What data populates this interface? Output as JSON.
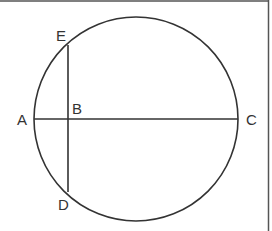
{
  "figure": {
    "stroke_color": "#333333",
    "border_color": "#555555",
    "points": {
      "A": {
        "label": "A",
        "x": 34,
        "y": 119
      },
      "B": {
        "label": "B",
        "x": 68,
        "y": 119
      },
      "C": {
        "label": "C",
        "x": 238,
        "y": 119
      },
      "D": {
        "label": "D",
        "x": 68,
        "y": 192
      },
      "E": {
        "label": "E",
        "x": 68,
        "y": 45
      }
    },
    "circle": {
      "cx": 136,
      "cy": 119,
      "r": 102
    },
    "segments": [
      "AC",
      "ED"
    ]
  }
}
